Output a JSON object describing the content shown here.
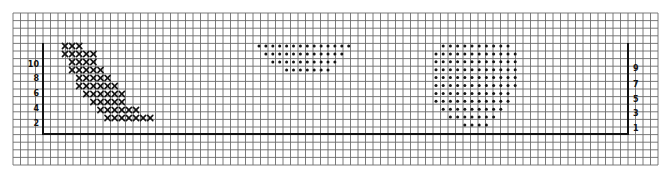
{
  "figure": {
    "colors": {
      "ink": "#141414",
      "grid": "#6b6b6b",
      "paper": "#ffffff"
    }
  },
  "left_axis": {
    "labels": [
      "10",
      "8",
      "6",
      "4",
      "2"
    ]
  },
  "right_axis": {
    "labels": [
      "9",
      "7",
      "5",
      "3",
      "1"
    ]
  },
  "shapes": {
    "x_band": {
      "marker": "x",
      "rows": [
        {
          "row": 0,
          "start_col": 0,
          "count": 3
        },
        {
          "row": 1,
          "start_col": 0,
          "count": 5
        },
        {
          "row": 2,
          "start_col": 1,
          "count": 4
        },
        {
          "row": 3,
          "start_col": 1,
          "count": 5
        },
        {
          "row": 4,
          "start_col": 2,
          "count": 5
        },
        {
          "row": 5,
          "start_col": 2,
          "count": 6
        },
        {
          "row": 6,
          "start_col": 3,
          "count": 6
        },
        {
          "row": 7,
          "start_col": 4,
          "count": 5
        },
        {
          "row": 8,
          "start_col": 5,
          "count": 6
        },
        {
          "row": 9,
          "start_col": 6,
          "count": 7
        }
      ]
    },
    "dot_trapezoid": {
      "marker": "dot",
      "rows": [
        {
          "row": 0,
          "start_col": 0,
          "count": 14
        },
        {
          "row": 1,
          "start_col": 1,
          "count": 12
        },
        {
          "row": 2,
          "start_col": 2,
          "count": 10
        },
        {
          "row": 3,
          "start_col": 4,
          "count": 7
        }
      ]
    },
    "dot_circle": {
      "marker": "dot",
      "rows": [
        {
          "row": 0,
          "start_col": 1,
          "count": 10
        },
        {
          "row": 1,
          "start_col": 0,
          "count": 12
        },
        {
          "row": 2,
          "start_col": 0,
          "count": 12
        },
        {
          "row": 3,
          "start_col": 0,
          "count": 12
        },
        {
          "row": 4,
          "start_col": 0,
          "count": 12
        },
        {
          "row": 5,
          "start_col": 0,
          "count": 12
        },
        {
          "row": 6,
          "start_col": 0,
          "count": 11
        },
        {
          "row": 7,
          "start_col": 0,
          "count": 11
        },
        {
          "row": 8,
          "start_col": 1,
          "count": 9
        },
        {
          "row": 9,
          "start_col": 2,
          "count": 7
        },
        {
          "row": 10,
          "start_col": 4,
          "count": 4
        }
      ]
    }
  }
}
